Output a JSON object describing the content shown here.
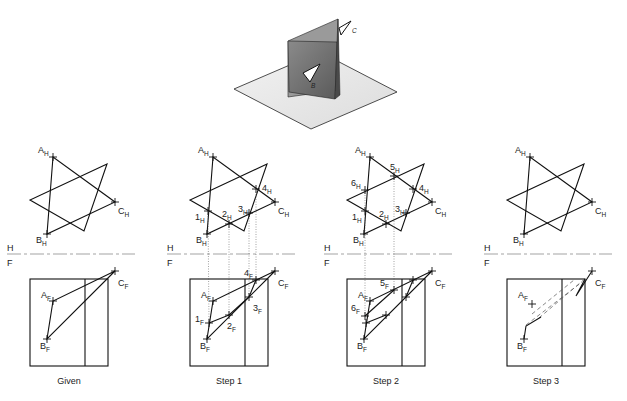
{
  "figure": {
    "isometric": {
      "label_b": "B",
      "label_c": "C"
    },
    "fold_line": {
      "top_label": "H",
      "bottom_label": "F"
    },
    "panels": [
      {
        "caption": "Given",
        "dx": 0,
        "points_h": [
          "A",
          "B",
          "C"
        ],
        "numbered_h": [],
        "numbered_f": [],
        "points_f": [
          "A",
          "B",
          "C"
        ]
      },
      {
        "caption": "Step 1",
        "dx": 160,
        "numbered_h": [
          "1",
          "2",
          "3",
          "4"
        ],
        "numbered_f": [
          "1",
          "2",
          "3",
          "4"
        ]
      },
      {
        "caption": "Step 2",
        "dx": 317,
        "numbered_h": [
          "1",
          "2",
          "3",
          "4",
          "5",
          "6"
        ],
        "numbered_f": [
          "5",
          "6"
        ]
      },
      {
        "caption": "Step 3",
        "dx": 477,
        "numbered_h": [],
        "numbered_f": []
      }
    ],
    "labels": {
      "A": "A",
      "B": "B",
      "C": "C",
      "H": "H",
      "F": "F",
      "n1": "1",
      "n2": "2",
      "n3": "3",
      "n4": "4",
      "n5": "5",
      "n6": "6"
    }
  }
}
